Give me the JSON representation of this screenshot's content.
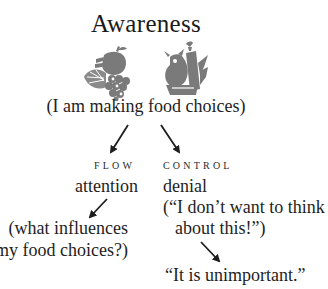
{
  "title": "Awareness",
  "icons": [
    {
      "name": "fruit-cluster-icon",
      "description": "orange slice, apple and grapes"
    },
    {
      "name": "vegetable-cluster-icon",
      "description": "pear, bottle and carrots"
    }
  ],
  "subtitle": "(I am making food choices)",
  "branches": {
    "flow": {
      "label": "FLOW",
      "term": "attention",
      "detail_lines": [
        "(what influences",
        "my food choices?)"
      ]
    },
    "control": {
      "label": "CONTROL",
      "term": "denial",
      "detail_lines": [
        "(“I don’t want to think",
        "about this!”)"
      ],
      "outcome": "“It is unimportant.”"
    }
  },
  "colors": {
    "text": "#1e1e1e",
    "icon": "#7a7a7a",
    "arrow": "#1e1e1e",
    "background": "#ffffff"
  }
}
